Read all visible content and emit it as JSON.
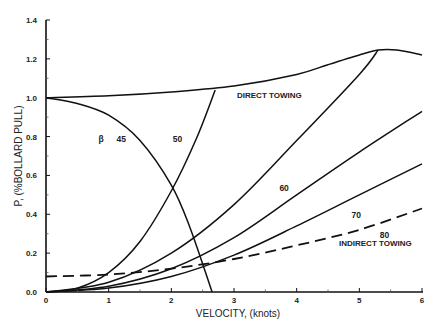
{
  "chart_data": {
    "type": "line",
    "title": "",
    "xlabel": "VELOCITY, (knots)",
    "ylabel": "P, (%BOLLARD PULL)",
    "xlim": [
      0,
      6
    ],
    "ylim": [
      0,
      1.4
    ],
    "x_ticks": [
      "0",
      "1",
      "2",
      "3",
      "4",
      "5",
      "6"
    ],
    "y_ticks": [
      "0.0",
      "0.2",
      "0.4",
      "0.6",
      "0.8",
      "1.0",
      "1.2",
      "1.4"
    ],
    "grid": false,
    "legend": "none (inline labels)",
    "beta_symbol": "β",
    "annotations": [
      "DIRECT TOWING",
      "INDIRECT TOWING"
    ],
    "series": [
      {
        "name": "DIRECT TOWING",
        "style": "solid",
        "x": [
          0,
          1,
          2,
          3,
          4,
          4.5,
          5,
          5.3,
          5.6,
          6
        ],
        "y": [
          1.0,
          1.01,
          1.03,
          1.06,
          1.12,
          1.17,
          1.22,
          1.245,
          1.245,
          1.22
        ]
      },
      {
        "name": "45",
        "style": "solid",
        "x": [
          0,
          0.5,
          1,
          1.5,
          2,
          2.3,
          2.65
        ],
        "y": [
          1.0,
          0.97,
          0.91,
          0.78,
          0.55,
          0.33,
          0.0
        ]
      },
      {
        "name": "50",
        "style": "solid",
        "x": [
          0,
          0.5,
          1,
          1.5,
          2,
          2.4,
          2.7
        ],
        "y": [
          0.0,
          0.02,
          0.1,
          0.26,
          0.52,
          0.79,
          1.04
        ]
      },
      {
        "name": "60",
        "style": "solid",
        "x": [
          0,
          1,
          2,
          3,
          4,
          5,
          5.3
        ],
        "y": [
          0.0,
          0.05,
          0.2,
          0.45,
          0.78,
          1.12,
          1.245
        ]
      },
      {
        "name": "70",
        "style": "solid",
        "x": [
          0,
          1,
          2,
          3,
          4,
          5,
          6
        ],
        "y": [
          0.0,
          0.03,
          0.12,
          0.28,
          0.5,
          0.72,
          0.93
        ]
      },
      {
        "name": "80",
        "style": "solid",
        "x": [
          0,
          1,
          2,
          3,
          4,
          5,
          6
        ],
        "y": [
          0.0,
          0.02,
          0.08,
          0.19,
          0.34,
          0.5,
          0.66
        ]
      },
      {
        "name": "INDIRECT TOWING",
        "style": "dashed",
        "x": [
          0,
          1,
          2,
          3,
          4,
          5,
          6
        ],
        "y": [
          0.08,
          0.09,
          0.12,
          0.17,
          0.24,
          0.32,
          0.43
        ]
      }
    ],
    "curve_labels": [
      {
        "text": "β",
        "x": 0.88,
        "y": 0.77
      },
      {
        "text": "45",
        "x": 1.2,
        "y": 0.77
      },
      {
        "text": "50",
        "x": 2.1,
        "y": 0.77
      },
      {
        "text": "60",
        "x": 3.8,
        "y": 0.52
      },
      {
        "text": "70",
        "x": 4.95,
        "y": 0.38
      },
      {
        "text": "80",
        "x": 5.4,
        "y": 0.28
      }
    ]
  }
}
